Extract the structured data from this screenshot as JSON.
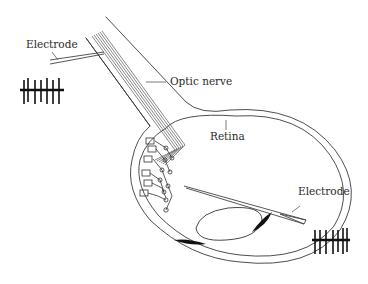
{
  "figure": {
    "labels": {
      "electrode_top": "Electrode",
      "optic_nerve": "Optic nerve",
      "retina": "Retina",
      "electrode_right": "Electrode"
    },
    "spike_trains": [
      {
        "name": "optic-nerve-recording",
        "spike_count": 7
      },
      {
        "name": "retina-recording",
        "spike_count": 7
      }
    ],
    "colors": {
      "line": "#3a3a3a",
      "ink": "#111111",
      "background": "#ffffff"
    }
  }
}
